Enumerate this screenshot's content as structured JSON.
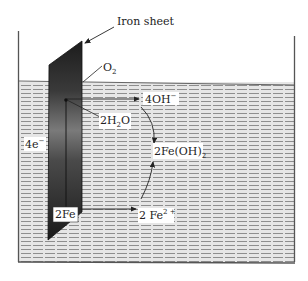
{
  "diagram": {
    "title_label": "Iron sheet",
    "labels": {
      "oxygen": "O",
      "oxygen_sub": "2",
      "hydroxide": "4OH",
      "hydroxide_sup": "−",
      "water_coef": "2H",
      "water_sub": "2",
      "water_tail": "O",
      "electrons": "4e",
      "electrons_sup": "−",
      "ferrous_hydroxide": "2Fe(OH)",
      "ferrous_hydroxide_sub": "2",
      "iron": "2Fe",
      "ferrous_ion": "2 Fe",
      "ferrous_ion_sup": "2 +"
    },
    "colors": {
      "sheet_dark": "#1e1e1e",
      "sheet_mid": "#5a5a5a",
      "sheet_light": "#9a9a9a",
      "water_bg": "#e4e4e4",
      "water_dash": "#8c8c8c",
      "container_line": "#555555",
      "ink": "#222222"
    }
  }
}
